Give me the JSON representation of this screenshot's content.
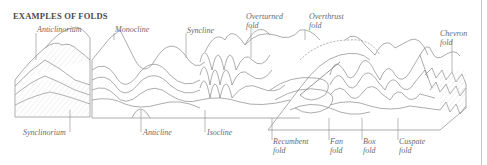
{
  "title": "EXAMPLES OF FOLDS",
  "labels_top": {
    "anticlinorium": "Anticlinorium",
    "monocline": "Monocline",
    "syncline": "Syncline",
    "overturned_fold": "Overturned\nfold",
    "overthrust_fold": "Overthrust\nfold",
    "chevron_fold": "Chevron\nfold"
  },
  "labels_bottom": {
    "synclinorium": "Synclinorium",
    "anticline": "Anticline",
    "isocline": "Isocline",
    "recumbent_fold": "Recumbent\nfold",
    "fan_fold": "Fan\nfold",
    "box_fold": "Box\nfold",
    "cuspate_fold": "Cuspate\nfold"
  },
  "colors": {
    "line": "#8a8a8a",
    "hatch": "#cfcfcf",
    "text": "#6a6a6a",
    "title": "#4a4a4a"
  }
}
